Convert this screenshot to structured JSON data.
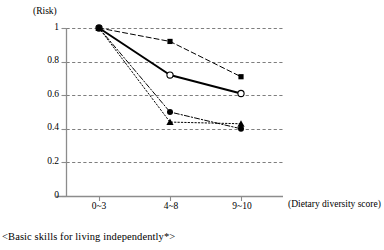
{
  "chart_data": {
    "type": "line",
    "title": "",
    "subtitle": "",
    "xlabel": "(Dietary diversity score)",
    "ylabel": "(Risk)",
    "categories": [
      "0~3",
      "4~8",
      "9~10"
    ],
    "ylim": [
      0,
      1
    ],
    "yticks": [
      "0",
      "0.2",
      "0.4",
      "0.6",
      "0.8",
      "1"
    ],
    "ytick_values": [
      0,
      0.2,
      0.4,
      0.6,
      0.8,
      1
    ],
    "grid": true,
    "grid_style": "dashed-horizontal",
    "legend": "none",
    "legend_position": "none",
    "annotation": "<Basic skills for living independently*>",
    "series": [
      {
        "name": "series-filled-square",
        "marker": "filled-square",
        "line_style": "dashed",
        "line_width": 1,
        "color": "#000000",
        "values": [
          1.0,
          0.92,
          0.71
        ]
      },
      {
        "name": "series-open-circle",
        "marker": "open-circle",
        "line_style": "solid",
        "line_width": 2,
        "color": "#000000",
        "values": [
          1.0,
          0.72,
          0.61
        ]
      },
      {
        "name": "series-filled-circle",
        "marker": "filled-circle",
        "line_style": "dash-dot",
        "line_width": 1,
        "color": "#000000",
        "values": [
          1.0,
          0.5,
          0.4
        ]
      },
      {
        "name": "series-filled-triangle",
        "marker": "filled-triangle",
        "line_style": "dotted",
        "line_width": 1,
        "color": "#000000",
        "values": [
          1.0,
          0.44,
          0.43
        ]
      }
    ]
  },
  "axis": {
    "y_title": "(Risk)",
    "x_title": "(Dietary diversity score)",
    "ytick_0": "0",
    "ytick_1": "0.2",
    "ytick_2": "0.4",
    "ytick_3": "0.6",
    "ytick_4": "0.8",
    "ytick_5": "1",
    "xtick_0": "0~3",
    "xtick_1": "4~8",
    "xtick_2": "9~10"
  },
  "caption": {
    "text": "<Basic skills for living independently*>"
  },
  "colors": {
    "axis": "#8c8c8c",
    "grid": "#6f6f6f",
    "data": "#000000",
    "background": "#ffffff"
  }
}
